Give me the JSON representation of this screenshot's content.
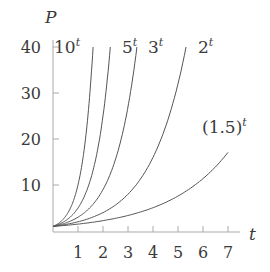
{
  "chart_data": {
    "type": "line",
    "title": "",
    "xlabel": "t",
    "ylabel": "P",
    "xlim": [
      0,
      7.5
    ],
    "ylim": [
      0,
      42
    ],
    "x_ticks": [
      1,
      2,
      3,
      4,
      5,
      6,
      7
    ],
    "y_ticks": [
      10,
      20,
      30,
      40
    ],
    "grid": false,
    "legend": "inline labels",
    "series": [
      {
        "name": "10^t",
        "base": 10,
        "label_base": "10",
        "label_exp": "t"
      },
      {
        "name": "5^t",
        "base": 5,
        "label_base": "5",
        "label_exp": "t"
      },
      {
        "name": "3^t",
        "base": 3,
        "label_base": "3",
        "label_exp": "t"
      },
      {
        "name": "2^t",
        "base": 2,
        "label_base": "2",
        "label_exp": "t"
      },
      {
        "name": "(1.5)^t",
        "base": 1.5,
        "label_base": "(1.5)",
        "label_exp": "t"
      }
    ]
  },
  "axes": {
    "x_label": "t",
    "y_label": "P",
    "x_tick_labels": [
      "1",
      "2",
      "3",
      "4",
      "5",
      "6",
      "7"
    ],
    "y_tick_labels": [
      "10",
      "20",
      "30",
      "40"
    ]
  },
  "colors": {
    "curve": "#555555",
    "axis": "#aaaaaa",
    "text": "#3a3a3a"
  }
}
